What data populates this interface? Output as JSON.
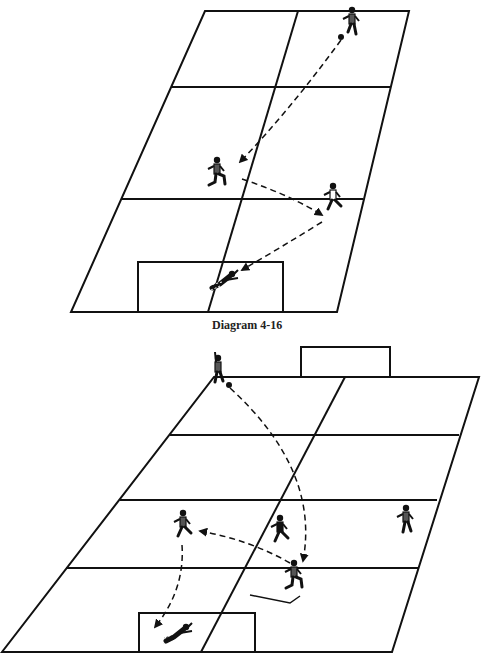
{
  "colors": {
    "line": "#111111",
    "shirt": "#555555",
    "background": "#ffffff"
  },
  "diagram_top": {
    "caption": "Diagram 4-16",
    "field_outline": [
      [
        205,
        11
      ],
      [
        409,
        11
      ],
      [
        337,
        312
      ],
      [
        71,
        312
      ]
    ],
    "horizontal_lines": [
      [
        [
          171,
          87
        ],
        [
          391,
          87
        ]
      ],
      [
        [
          121,
          199
        ],
        [
          363,
          199
        ]
      ]
    ],
    "center_line": [
      [
        298,
        11
      ],
      [
        208,
        312
      ]
    ],
    "goal_box": [
      [
        138,
        312
      ],
      [
        138,
        262
      ],
      [
        283,
        262
      ],
      [
        283,
        312
      ]
    ],
    "players": [
      {
        "id": "attacker-top-right",
        "x": 352,
        "y": 22,
        "pose": "dribbling",
        "shirt": "grey"
      },
      {
        "id": "midfielder-left",
        "x": 217,
        "y": 172,
        "pose": "receiving",
        "shirt": "grey"
      },
      {
        "id": "forward-right",
        "x": 333,
        "y": 198,
        "pose": "running",
        "shirt": "white"
      },
      {
        "id": "goalkeeper",
        "x": 224,
        "y": 280,
        "pose": "diving",
        "shirt": "black"
      }
    ],
    "ball": {
      "x": 341,
      "y": 37
    },
    "passes": [
      {
        "from": [
          341,
          40
        ],
        "ctrl": [
          290,
          110
        ],
        "to": [
          240,
          162
        ]
      },
      {
        "from": [
          242,
          179
        ],
        "ctrl": [
          290,
          195
        ],
        "to": [
          322,
          215
        ]
      },
      {
        "from": [
          322,
          222
        ],
        "ctrl": [
          280,
          248
        ],
        "to": [
          242,
          270
        ]
      }
    ]
  },
  "diagram_bottom": {
    "caption": "",
    "field_outline": [
      [
        214,
        377
      ],
      [
        479,
        377
      ],
      [
        392,
        652
      ],
      [
        2,
        652
      ]
    ],
    "horizontal_lines": [
      [
        [
          170,
          435
        ],
        [
          459,
          435
        ]
      ],
      [
        [
          120,
          500
        ],
        [
          437,
          500
        ]
      ],
      [
        [
          66,
          568
        ],
        [
          418,
          568
        ]
      ]
    ],
    "center_line": [
      [
        345,
        377
      ],
      [
        201,
        652
      ]
    ],
    "top_goal_box": [
      [
        301,
        377
      ],
      [
        301,
        347
      ],
      [
        390,
        347
      ],
      [
        390,
        377
      ]
    ],
    "bottom_goal_box": [
      [
        139,
        652
      ],
      [
        139,
        613
      ],
      [
        255,
        613
      ],
      [
        255,
        652
      ]
    ],
    "players": [
      {
        "id": "winger-top",
        "x": 218,
        "y": 370,
        "pose": "arm-raised",
        "shirt": "grey"
      },
      {
        "id": "attacker-left",
        "x": 183,
        "y": 525,
        "pose": "running",
        "shirt": "grey"
      },
      {
        "id": "defender-center",
        "x": 280,
        "y": 530,
        "pose": "running",
        "shirt": "black"
      },
      {
        "id": "player-right",
        "x": 406,
        "y": 520,
        "pose": "standing",
        "shirt": "grey"
      },
      {
        "id": "striker-center",
        "x": 294,
        "y": 575,
        "pose": "receiving",
        "shirt": "grey"
      },
      {
        "id": "goalkeeper",
        "x": 178,
        "y": 633,
        "pose": "diving",
        "shirt": "white"
      }
    ],
    "ball": {
      "x": 229,
      "y": 385
    },
    "passes": [
      {
        "from": [
          230,
          388
        ],
        "ctrl": [
          320,
          470
        ],
        "to": [
          303,
          561
        ]
      },
      {
        "from": [
          290,
          563
        ],
        "ctrl": [
          250,
          540
        ],
        "to": [
          200,
          531
        ]
      },
      {
        "from": [
          182,
          545
        ],
        "ctrl": [
          185,
          590
        ],
        "to": [
          155,
          627
        ]
      }
    ],
    "run_line": [
      [
        250,
        595
      ],
      [
        290,
        603
      ],
      [
        300,
        596
      ]
    ]
  }
}
